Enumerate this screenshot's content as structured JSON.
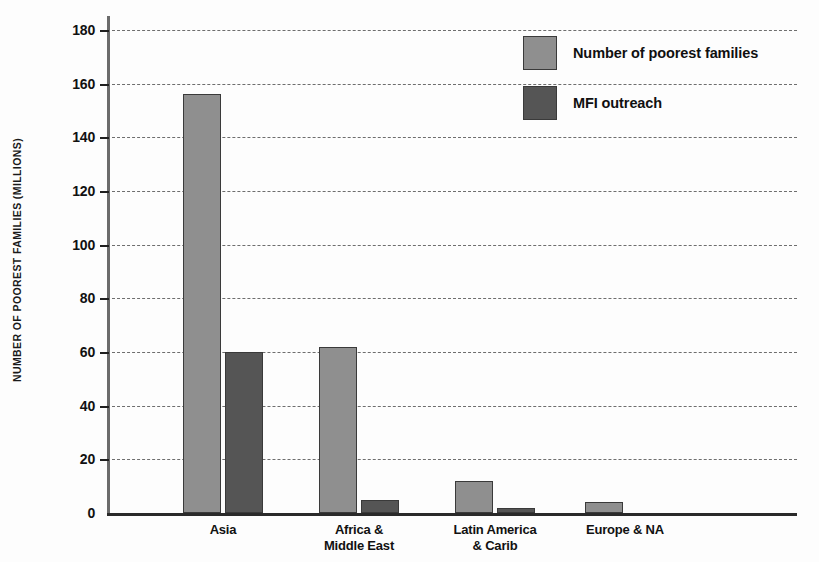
{
  "chart_data": {
    "type": "bar",
    "title": "",
    "xlabel": "",
    "ylabel": "NUMBER OF POOREST FAMILIES (MILLIONS)",
    "ylim": [
      0,
      180
    ],
    "ytick_values": [
      0,
      20,
      40,
      60,
      80,
      100,
      120,
      140,
      160,
      180
    ],
    "ytick_labels": [
      "0",
      "20",
      "40",
      "60",
      "80",
      "100",
      "120",
      "140",
      "160",
      "180"
    ],
    "grid": "horizontal-dashed",
    "legend_position": "top-right",
    "categories": [
      "Asia",
      "Africa &\nMiddle East",
      "Latin America\n& Carib",
      "Europe & NA"
    ],
    "category_lines": [
      [
        "Asia"
      ],
      [
        "Africa &",
        "Middle East"
      ],
      [
        "Latin America",
        "& Carib"
      ],
      [
        "Europe & NA"
      ]
    ],
    "series": [
      {
        "name": "Number of poorest families",
        "color": "#8f8f8f",
        "values": [
          156,
          62,
          12,
          4
        ]
      },
      {
        "name": "MFI outreach",
        "color": "#555555",
        "values": [
          60,
          5,
          2,
          0
        ]
      }
    ]
  },
  "legend": {
    "items": [
      {
        "label": "Number of poorest families",
        "color": "#8f8f8f"
      },
      {
        "label": "MFI outreach",
        "color": "#555555"
      }
    ]
  }
}
